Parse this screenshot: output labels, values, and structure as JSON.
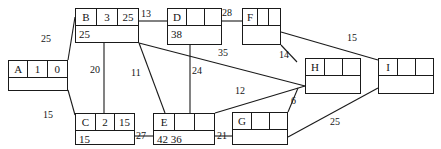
{
  "diagram": {
    "line_color": "#1a1a1a",
    "text_color": "#141414",
    "background": "#ffffff",
    "nodes": [
      {
        "id": "A",
        "label": "A",
        "cells": [
          "A",
          "1",
          "0"
        ],
        "bottom": ""
      },
      {
        "id": "B",
        "label": "B",
        "cells": [
          "B",
          "3",
          "25"
        ],
        "bottom": "25"
      },
      {
        "id": "C",
        "label": "C",
        "cells": [
          "C",
          "2",
          "15"
        ],
        "bottom": "15"
      },
      {
        "id": "D",
        "label": "D",
        "cells": [
          "D",
          "",
          ""
        ],
        "bottom": "38"
      },
      {
        "id": "E",
        "label": "E",
        "cells": [
          "E",
          "",
          ""
        ],
        "bottom": "42 36"
      },
      {
        "id": "F",
        "label": "F",
        "cells": [
          "F",
          "",
          ""
        ],
        "bottom": ""
      },
      {
        "id": "G",
        "label": "G",
        "cells": [
          "G",
          "",
          ""
        ],
        "bottom": ""
      },
      {
        "id": "H",
        "label": "H",
        "cells": [
          "H",
          "",
          ""
        ],
        "bottom": ""
      },
      {
        "id": "I",
        "label": "I",
        "cells": [
          "I",
          "",
          ""
        ],
        "bottom": ""
      }
    ],
    "edges": [
      {
        "from": "A",
        "to": "B",
        "weight": "25"
      },
      {
        "from": "A",
        "to": "C",
        "weight": "15"
      },
      {
        "from": "B",
        "to": "D",
        "weight": "13"
      },
      {
        "from": "B",
        "to": "C",
        "weight": "20"
      },
      {
        "from": "B",
        "to": "E",
        "weight": "11"
      },
      {
        "from": "B",
        "to": "H",
        "weight": "35"
      },
      {
        "from": "D",
        "to": "F",
        "weight": "28"
      },
      {
        "from": "D",
        "to": "E",
        "weight": "24"
      },
      {
        "from": "C",
        "to": "E",
        "weight": "27"
      },
      {
        "from": "E",
        "to": "G",
        "weight": "21"
      },
      {
        "from": "E",
        "to": "H",
        "weight": "12"
      },
      {
        "from": "F",
        "to": "H",
        "weight": "14"
      },
      {
        "from": "F",
        "to": "I",
        "weight": "15"
      },
      {
        "from": "H",
        "to": "G",
        "weight": "6"
      },
      {
        "from": "G",
        "to": "I",
        "weight": "25"
      }
    ]
  }
}
